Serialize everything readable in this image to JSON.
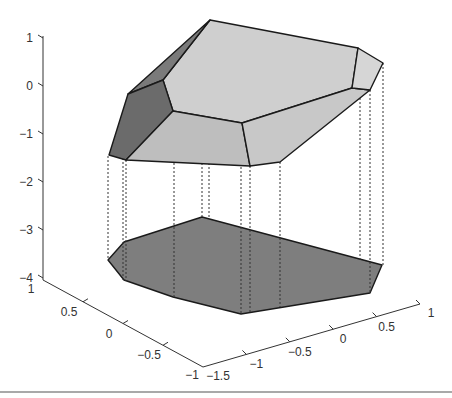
{
  "figure": {
    "z_axis": {
      "ticks": [
        "1",
        "0",
        "−1",
        "−2",
        "−3",
        "−4"
      ],
      "values": [
        1,
        0,
        -1,
        -2,
        -3,
        -4
      ]
    },
    "y_axis": {
      "ticks": [
        "1",
        "0.5",
        "0",
        "−0.5",
        "−1"
      ],
      "values": [
        1,
        0.5,
        0,
        -0.5,
        -1
      ]
    },
    "x_axis": {
      "ticks": [
        "−1.5",
        "−1",
        "−0.5",
        "0",
        "0.5",
        "1"
      ],
      "values": [
        -1.5,
        -1,
        -0.5,
        0,
        0.5,
        1
      ]
    },
    "colors": {
      "top_face": "#cfcfcf",
      "front_face": "#bebebe",
      "right_face": "#d2d2d2",
      "dark_face": "#6b6b6b",
      "strip_face": "#7a7a7a",
      "shadow_face": "#7e7e7e",
      "edge": "#1a1a1a"
    }
  }
}
